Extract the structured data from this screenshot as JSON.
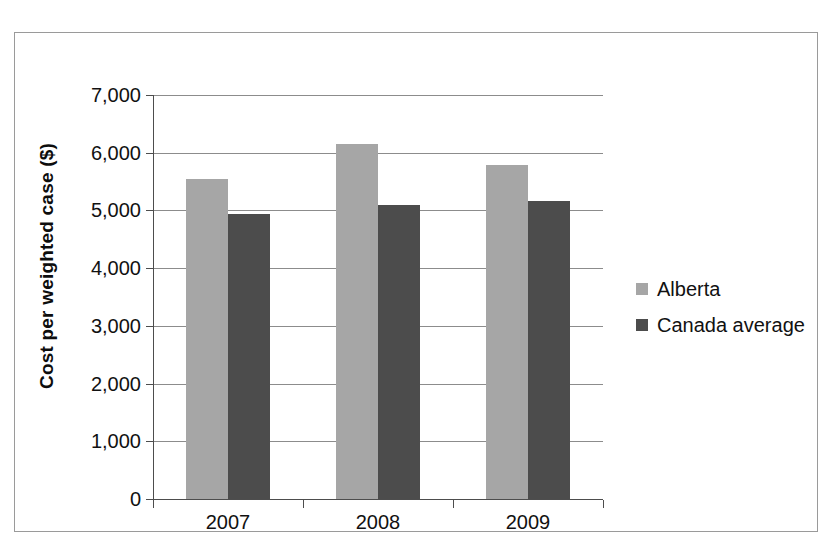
{
  "chart_data": {
    "type": "bar",
    "title": "",
    "xlabel": "",
    "ylabel": "Cost per weighted case ($)",
    "categories": [
      "2007",
      "2008",
      "2009"
    ],
    "series": [
      {
        "name": "Alberta",
        "color": "#a6a6a6",
        "values": [
          5550,
          6150,
          5780
        ]
      },
      {
        "name": "Canada average",
        "color": "#4c4c4c",
        "values": [
          4930,
          5100,
          5170
        ]
      }
    ],
    "ylim": [
      0,
      7000
    ],
    "yticks": [
      0,
      1000,
      2000,
      3000,
      4000,
      5000,
      6000,
      7000
    ],
    "ytick_labels": [
      "0",
      "1,000",
      "2,000",
      "3,000",
      "4,000",
      "5,000",
      "6,000",
      "7,000"
    ],
    "grid": true,
    "legend_position": "right"
  },
  "legend": {
    "items": [
      {
        "label": "Alberta",
        "color": "#a6a6a6"
      },
      {
        "label": "Canada average",
        "color": "#4c4c4c"
      }
    ]
  }
}
